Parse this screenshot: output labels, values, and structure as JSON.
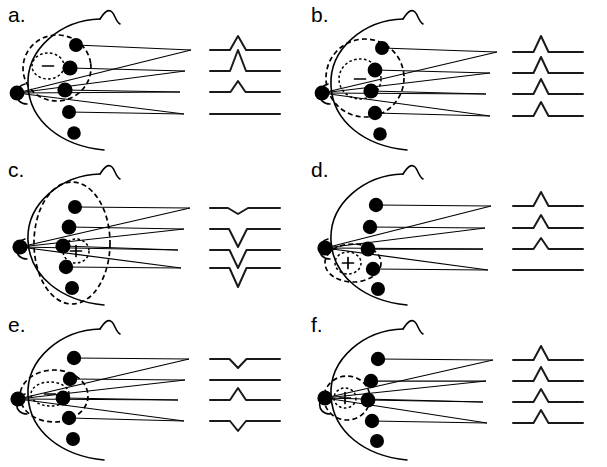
{
  "figure": {
    "title": "",
    "background": "#ffffff",
    "ink_color": "#000000",
    "panel_count": 6,
    "layout": {
      "columns": 2,
      "rows": 3,
      "panel_width": 303,
      "panel_height": 155
    }
  },
  "legend": {
    "head_outline": "left-facing head profile with nose and ear notch",
    "electrode_symbol": "filled black circle",
    "reference_electrode": "filled black circle at far left (ear/mastoid reference)",
    "dipole_field_symbol": "dashed ellipse iso-potential contour",
    "dipole_core_symbol": "dotted inner ellipse with polarity sign",
    "lead_symbol": "thin line from electrode to waveform trace",
    "waveform_symbol": "horizontal baseline with single deflection"
  },
  "panels": [
    {
      "id": "a",
      "label": "a.",
      "position": {
        "x": 0,
        "y": 0
      },
      "dipole": {
        "polarity": "-",
        "polarity_label": "minus",
        "depth": "superficial",
        "location": "anterior-superior, mid-depth",
        "core_cx": 48,
        "core_cy": 66,
        "core_rx": 16,
        "core_ry": 13,
        "field_cx": 57,
        "field_cy": 68,
        "field_rx": 34,
        "field_ry": 33,
        "field_rotation": -8
      },
      "electrodes": [
        {
          "name": "electrode-1",
          "cx": 76,
          "cy": 45,
          "r": 7.0
        },
        {
          "name": "electrode-2",
          "cx": 70,
          "cy": 68,
          "r": 7.6
        },
        {
          "name": "electrode-3",
          "cx": 65,
          "cy": 90,
          "r": 7.6
        },
        {
          "name": "electrode-4",
          "cx": 69,
          "cy": 112,
          "r": 7.0
        },
        {
          "name": "electrode-5",
          "cx": 74,
          "cy": 133,
          "r": 6.8
        }
      ],
      "reference_electrode": {
        "name": "reference-electrode",
        "cx": 17,
        "cy": 93,
        "r": 7.4
      },
      "waveforms": [
        {
          "name": "trace-1",
          "baseline_y": 50,
          "polarity": "positive",
          "amplitude": 14,
          "width": 16,
          "label": ""
        },
        {
          "name": "trace-2",
          "baseline_y": 71,
          "polarity": "positive",
          "amplitude": 21,
          "width": 16,
          "label": ""
        },
        {
          "name": "trace-3",
          "baseline_y": 92,
          "polarity": "positive",
          "amplitude": 11,
          "width": 15,
          "label": ""
        },
        {
          "name": "trace-4",
          "baseline_y": 114,
          "polarity": "flat",
          "amplitude": 0,
          "width": 0,
          "label": ""
        }
      ]
    },
    {
      "id": "b",
      "label": "b.",
      "position": {
        "x": 303,
        "y": 0
      },
      "dipole": {
        "polarity": "-",
        "polarity_label": "minus",
        "depth": "deep",
        "location": "central, deep",
        "core_cx": 57,
        "core_cy": 79,
        "core_rx": 21,
        "core_ry": 20,
        "field_cx": 62,
        "field_cy": 78,
        "field_rx": 39,
        "field_ry": 39,
        "field_rotation": 0
      },
      "electrodes": [
        {
          "name": "electrode-1",
          "cx": 79,
          "cy": 48,
          "r": 7.0
        },
        {
          "name": "electrode-2",
          "cx": 72,
          "cy": 70,
          "r": 7.4
        },
        {
          "name": "electrode-3",
          "cx": 68,
          "cy": 91,
          "r": 7.6
        },
        {
          "name": "electrode-4",
          "cx": 72,
          "cy": 113,
          "r": 7.2
        },
        {
          "name": "electrode-5",
          "cx": 77,
          "cy": 134,
          "r": 6.8
        }
      ],
      "reference_electrode": {
        "name": "reference-electrode",
        "cx": 19,
        "cy": 93,
        "r": 7.4
      },
      "waveforms": [
        {
          "name": "trace-1",
          "baseline_y": 52,
          "polarity": "positive",
          "amplitude": 16,
          "width": 15,
          "label": ""
        },
        {
          "name": "trace-2",
          "baseline_y": 73,
          "polarity": "positive",
          "amplitude": 16,
          "width": 15,
          "label": ""
        },
        {
          "name": "trace-3",
          "baseline_y": 94,
          "polarity": "positive",
          "amplitude": 15,
          "width": 15,
          "label": ""
        },
        {
          "name": "trace-4",
          "baseline_y": 116,
          "polarity": "positive",
          "amplitude": 14,
          "width": 15,
          "label": ""
        }
      ]
    },
    {
      "id": "c",
      "label": "c.",
      "position": {
        "x": 0,
        "y": 155
      },
      "dipole": {
        "polarity": "+",
        "polarity_label": "plus",
        "depth": "deep",
        "location": "central, deep, tall vertical field",
        "core_cx": 76,
        "core_cy": 96,
        "core_rx": 13,
        "core_ry": 12,
        "field_cx": 72,
        "field_cy": 88,
        "field_rx": 38,
        "field_ry": 61,
        "field_rotation": 0
      },
      "electrodes": [
        {
          "name": "electrode-1",
          "cx": 75,
          "cy": 52,
          "r": 7.0
        },
        {
          "name": "electrode-2",
          "cx": 69,
          "cy": 72,
          "r": 7.4
        },
        {
          "name": "electrode-3",
          "cx": 63,
          "cy": 91,
          "r": 7.6
        },
        {
          "name": "electrode-4",
          "cx": 66,
          "cy": 112,
          "r": 7.2
        },
        {
          "name": "electrode-5",
          "cx": 72,
          "cy": 133,
          "r": 7.0
        }
      ],
      "reference_electrode": {
        "name": "reference-electrode",
        "cx": 20,
        "cy": 92,
        "r": 7.6
      },
      "waveforms": [
        {
          "name": "trace-1",
          "baseline_y": 53,
          "polarity": "negative",
          "amplitude": 6,
          "width": 20,
          "label": ""
        },
        {
          "name": "trace-2",
          "baseline_y": 74,
          "polarity": "negative",
          "amplitude": 18,
          "width": 18,
          "label": ""
        },
        {
          "name": "trace-3",
          "baseline_y": 95,
          "polarity": "negative",
          "amplitude": 18,
          "width": 17,
          "label": ""
        },
        {
          "name": "trace-4",
          "baseline_y": 113,
          "polarity": "negative",
          "amplitude": 19,
          "width": 17,
          "label": ""
        }
      ]
    },
    {
      "id": "d",
      "label": "d.",
      "position": {
        "x": 303,
        "y": 155
      },
      "dipole": {
        "polarity": "+",
        "polarity_label": "plus",
        "depth": "superficial",
        "location": "inferior-anterior, near reference",
        "core_cx": 45,
        "core_cy": 108,
        "core_rx": 13,
        "core_ry": 11,
        "field_cx": 50,
        "field_cy": 108,
        "field_rx": 28,
        "field_ry": 19,
        "field_rotation": 0
      },
      "electrodes": [
        {
          "name": "electrode-1",
          "cx": 73,
          "cy": 50,
          "r": 7.2
        },
        {
          "name": "electrode-2",
          "cx": 67,
          "cy": 72,
          "r": 7.2
        },
        {
          "name": "electrode-3",
          "cx": 65,
          "cy": 94,
          "r": 7.4
        },
        {
          "name": "electrode-4",
          "cx": 70,
          "cy": 114,
          "r": 7.2
        },
        {
          "name": "electrode-5",
          "cx": 75,
          "cy": 134,
          "r": 7.0
        }
      ],
      "reference_electrode": {
        "name": "reference-electrode",
        "cx": 22,
        "cy": 93,
        "r": 7.6
      },
      "waveforms": [
        {
          "name": "trace-1",
          "baseline_y": 51,
          "polarity": "positive",
          "amplitude": 14,
          "width": 15,
          "label": ""
        },
        {
          "name": "trace-2",
          "baseline_y": 73,
          "polarity": "positive",
          "amplitude": 13,
          "width": 15,
          "label": ""
        },
        {
          "name": "trace-3",
          "baseline_y": 94,
          "polarity": "positive",
          "amplitude": 11,
          "width": 15,
          "label": ""
        },
        {
          "name": "trace-4",
          "baseline_y": 115,
          "polarity": "flat",
          "amplitude": 0,
          "width": 0,
          "label": ""
        }
      ]
    },
    {
      "id": "e",
      "label": "e.",
      "position": {
        "x": 0,
        "y": 310
      },
      "dipole": {
        "polarity": "-",
        "polarity_label": "minus-bar",
        "depth": "mid",
        "location": "mid-anterior, horizontal field",
        "core_cx": 50,
        "core_cy": 84,
        "core_rx": 19,
        "core_ry": 12,
        "field_cx": 54,
        "field_cy": 86,
        "field_rx": 34,
        "field_ry": 26,
        "field_rotation": 0
      },
      "electrodes": [
        {
          "name": "electrode-1",
          "cx": 74,
          "cy": 48,
          "r": 7.2
        },
        {
          "name": "electrode-2",
          "cx": 70,
          "cy": 69,
          "r": 7.2
        },
        {
          "name": "electrode-3",
          "cx": 63,
          "cy": 88,
          "r": 7.4
        },
        {
          "name": "electrode-4",
          "cx": 69,
          "cy": 108,
          "r": 7.2
        },
        {
          "name": "electrode-5",
          "cx": 73,
          "cy": 129,
          "r": 7.0
        }
      ],
      "reference_electrode": {
        "name": "reference-electrode",
        "cx": 18,
        "cy": 89,
        "r": 7.6
      },
      "waveforms": [
        {
          "name": "trace-1",
          "baseline_y": 49,
          "polarity": "negative",
          "amplitude": 9,
          "width": 17,
          "label": ""
        },
        {
          "name": "trace-2",
          "baseline_y": 70,
          "polarity": "flat",
          "amplitude": 0,
          "width": 0,
          "label": ""
        },
        {
          "name": "trace-3",
          "baseline_y": 90,
          "polarity": "positive",
          "amplitude": 12,
          "width": 16,
          "label": ""
        },
        {
          "name": "trace-4",
          "baseline_y": 111,
          "polarity": "negative",
          "amplitude": 10,
          "width": 16,
          "label": ""
        }
      ]
    },
    {
      "id": "f",
      "label": "f.",
      "position": {
        "x": 303,
        "y": 310
      },
      "dipole": {
        "polarity": "+",
        "polarity_label": "plus",
        "depth": "superficial",
        "location": "anterior surface, at reference electrode",
        "core_cx": 42,
        "core_cy": 88,
        "core_rx": 11,
        "core_ry": 10,
        "field_cx": 44,
        "field_cy": 88,
        "field_rx": 23,
        "field_ry": 22,
        "field_rotation": 0
      },
      "electrodes": [
        {
          "name": "electrode-1",
          "cx": 75,
          "cy": 49,
          "r": 7.2
        },
        {
          "name": "electrode-2",
          "cx": 68,
          "cy": 71,
          "r": 7.2
        },
        {
          "name": "electrode-3",
          "cx": 65,
          "cy": 90,
          "r": 7.4
        },
        {
          "name": "electrode-4",
          "cx": 69,
          "cy": 111,
          "r": 7.2
        },
        {
          "name": "electrode-5",
          "cx": 74,
          "cy": 131,
          "r": 7.0
        }
      ],
      "reference_electrode": {
        "name": "reference-electrode",
        "cx": 22,
        "cy": 88,
        "r": 7.6
      },
      "waveforms": [
        {
          "name": "trace-1",
          "baseline_y": 50,
          "polarity": "positive",
          "amplitude": 14,
          "width": 15,
          "label": ""
        },
        {
          "name": "trace-2",
          "baseline_y": 71,
          "polarity": "positive",
          "amplitude": 14,
          "width": 15,
          "label": ""
        },
        {
          "name": "trace-3",
          "baseline_y": 92,
          "polarity": "positive",
          "amplitude": 13,
          "width": 15,
          "label": ""
        },
        {
          "name": "trace-4",
          "baseline_y": 113,
          "polarity": "positive",
          "amplitude": 13,
          "width": 15,
          "label": ""
        }
      ]
    }
  ]
}
